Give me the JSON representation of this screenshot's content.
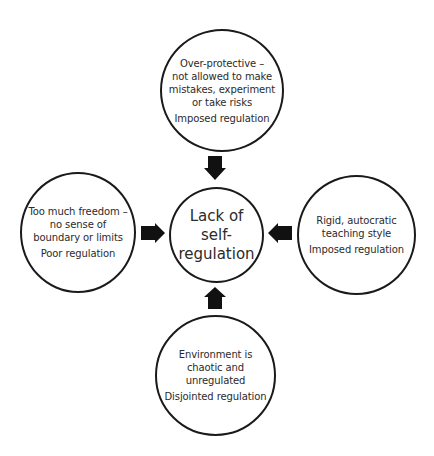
{
  "diagram": {
    "type": "concept-diagram",
    "center": {
      "lines": [
        "Lack of",
        "self-",
        "regulation"
      ]
    },
    "nodes": {
      "top": {
        "description_lines": [
          "Over-protective –",
          "not allowed to make",
          "mistakes, experiment",
          "or take risks"
        ],
        "regulation": "Imposed regulation",
        "arrow_direction": "down"
      },
      "left": {
        "description_lines": [
          "Too much freedom –",
          "no sense of",
          "boundary or limits"
        ],
        "regulation": "Poor regulation",
        "arrow_direction": "right"
      },
      "right": {
        "description_lines": [
          "Rigid, autocratic",
          "teaching style"
        ],
        "regulation": "Imposed regulation",
        "arrow_direction": "left"
      },
      "bottom": {
        "description_lines": [
          "Environment is",
          "chaotic and",
          "unregulated"
        ],
        "regulation": "Disjointed regulation",
        "arrow_direction": "up"
      }
    },
    "colors": {
      "stroke": "#1a1a1a",
      "arrow_fill": "#111111",
      "text": "#2b2b2b",
      "background": "#ffffff"
    }
  }
}
